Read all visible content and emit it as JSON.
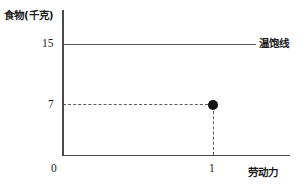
{
  "chart_data": {
    "type": "scatter",
    "title": "",
    "ylabel": "食物(千克)",
    "xlabel": "劳动力",
    "y_ticks": [
      "15",
      "7"
    ],
    "x_ticks": [
      "1"
    ],
    "origin_label": "0",
    "xlim": [
      0,
      1.52
    ],
    "ylim": [
      0,
      19
    ],
    "grid": false,
    "legend_position": "line-end-right",
    "series": [
      {
        "name": "温饱线",
        "type": "hline",
        "style": "solid",
        "y": 15,
        "x_start": 0,
        "x_end": 1.27,
        "label": "温饱线"
      },
      {
        "name": "生产点",
        "type": "point",
        "points": [
          {
            "x": 1,
            "y": 7
          }
        ],
        "marker": "filled-circle"
      },
      {
        "name": "食物水平参考线",
        "type": "hline",
        "style": "dashed",
        "y": 7,
        "x_start": 0,
        "x_end": 1
      },
      {
        "name": "劳动力水平参考线",
        "type": "vline",
        "style": "dashed",
        "x": 1,
        "y_start": 0,
        "y_end": 7
      }
    ]
  },
  "labels": {
    "y_axis_title": "食物(千克)",
    "x_axis_title": "劳动力",
    "tick_15": "15",
    "tick_7": "7",
    "tick_0": "0",
    "tick_1": "1",
    "subsistence_line": "温饱线"
  },
  "colors": {
    "axis": "#4a4a4a",
    "line": "#5a5a5a",
    "point": "#111111",
    "text": "#1c1c1c",
    "background": "#ffffff"
  }
}
